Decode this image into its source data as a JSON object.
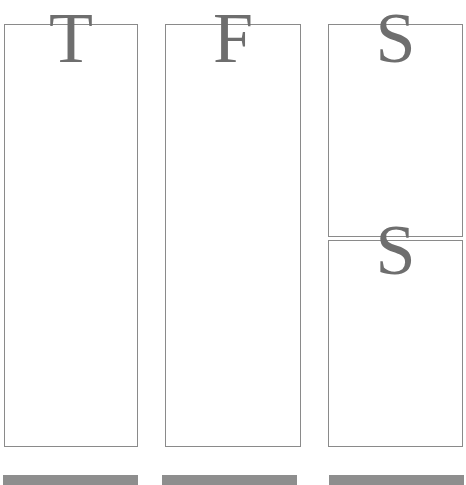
{
  "columns": [
    {
      "id": "t",
      "letter": "T"
    },
    {
      "id": "f",
      "letter": "F"
    },
    {
      "id": "s",
      "letters": [
        "S",
        "S"
      ]
    }
  ],
  "colors": {
    "border": "#8a8a8a",
    "letter": "#6e6e6e",
    "bar": "#8e8e8e",
    "background": "#ffffff"
  }
}
